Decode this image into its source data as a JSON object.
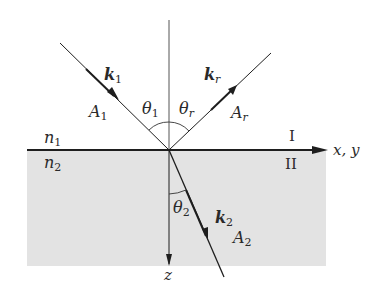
{
  "diagram": {
    "type": "refraction-at-interface",
    "colors": {
      "medium2_fill": "#e3e3e3",
      "line": "#1e1e1e",
      "text": "#2a2a2a"
    },
    "labels": {
      "k1": "k",
      "k1_sub": "1",
      "kr": "k",
      "kr_sub": "r",
      "k2": "k",
      "k2_sub": "2",
      "A1": "A",
      "A1_sub": "1",
      "Ar": "A",
      "Ar_sub": "r",
      "A2": "A",
      "A2_sub": "2",
      "theta1": "θ",
      "theta1_sub": "1",
      "thetar": "θ",
      "thetar_sub": "r",
      "theta2": "θ",
      "theta2_sub": "2",
      "n1": "n",
      "n1_sub": "1",
      "n2": "n",
      "n2_sub": "2",
      "region1": "I",
      "region2": "II",
      "axis_xy": "x, y",
      "axis_z": "z"
    }
  }
}
